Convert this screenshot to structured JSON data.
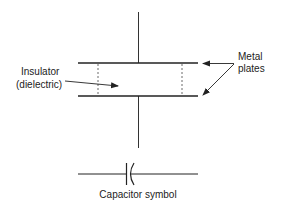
{
  "diagram": {
    "labels": {
      "metal_line1": "Metal",
      "metal_line2": "plates",
      "insulator_line1": "Insulator",
      "insulator_line2": "(dielectric)",
      "symbol_caption": "Capacitor symbol"
    },
    "colors": {
      "stroke": "#222222",
      "background": "#ffffff"
    }
  }
}
